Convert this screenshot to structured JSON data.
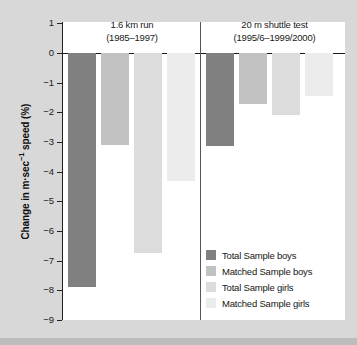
{
  "chart_data": {
    "type": "bar",
    "title": "",
    "subtitle": "",
    "xlabel": "",
    "ylabel": "Change in m·sec⁻¹ speed (%)",
    "ylim": [
      -9,
      1
    ],
    "ytick_labels": [
      "1",
      "0",
      "−1",
      "−2",
      "−3",
      "−4",
      "−5",
      "−6",
      "−7",
      "−8",
      "−9"
    ],
    "ytick_values": [
      1,
      0,
      -1,
      -2,
      -3,
      -4,
      -5,
      -6,
      -7,
      -8,
      -9
    ],
    "grid": false,
    "legend_position": "bottom-right",
    "categories": [
      "1.6 km run",
      "20 m shuttle test"
    ],
    "category_subtitles": [
      "(1985–1997)",
      "(1995/6–1999/2000)"
    ],
    "series": [
      {
        "name": "Total Sample boys",
        "color": "#808080",
        "values": [
          -7.9,
          -3.15
        ]
      },
      {
        "name": "Matched Sample boys",
        "color": "#c2c2c2",
        "values": [
          -3.1,
          -1.72
        ]
      },
      {
        "name": "Total Sample girls",
        "color": "#dcdcdc",
        "values": [
          -6.75,
          -2.08
        ]
      },
      {
        "name": "Matched Sample girls",
        "color": "#ececec",
        "values": [
          -4.3,
          -1.45
        ]
      }
    ]
  },
  "panels": [
    {
      "title": "1.6 km run",
      "period": "(1985–1997)"
    },
    {
      "title": "20 m shuttle test",
      "period": "(1995/6–1999/2000)"
    }
  ],
  "axis": {
    "y_title_main": "Change in m·sec",
    "y_title_exp": "−1",
    "y_title_tail": " speed (%)"
  },
  "legend": {
    "items": [
      {
        "label": "Total Sample boys",
        "color": "#808080"
      },
      {
        "label": "Matched Sample boys",
        "color": "#c2c2c2"
      },
      {
        "label": "Total Sample girls",
        "color": "#dcdcdc"
      },
      {
        "label": "Matched Sample girls",
        "color": "#ececec"
      }
    ]
  }
}
